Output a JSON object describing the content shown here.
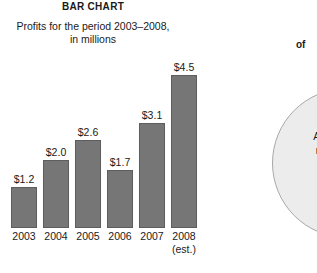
{
  "bar_chart": {
    "title": "BAR CHART",
    "subtitle_line1": "Profits for the period 2003–2008,",
    "subtitle_line2": "in millions"
  },
  "pie_chart": {
    "heading_fragment": "of",
    "heading_ghost": "",
    "label_line1": "Answ",
    "label_line2": "mad",
    "label_line3": "4"
  },
  "chart_data": {
    "type": "bar",
    "title": "BAR CHART",
    "subtitle": "Profits for the period 2003–2008, in millions",
    "xlabel": "",
    "ylabel": "Profits (millions of dollars)",
    "ylim": [
      0,
      5
    ],
    "grid": false,
    "legend": "none",
    "categories": [
      "2003",
      "2004",
      "2005",
      "2006",
      "2007",
      "2008"
    ],
    "category_notes": [
      "",
      "",
      "",
      "",
      "",
      "(est.)"
    ],
    "values": [
      1.2,
      2.0,
      2.6,
      1.7,
      3.1,
      4.5
    ],
    "value_labels": [
      "$1.2",
      "$2.0",
      "$2.6",
      "$1.7",
      "$3.1",
      "$4.5"
    ],
    "bar_color": "#767676",
    "bar_edge_color": "#5d5d5d",
    "background_color": "#ffffff"
  }
}
